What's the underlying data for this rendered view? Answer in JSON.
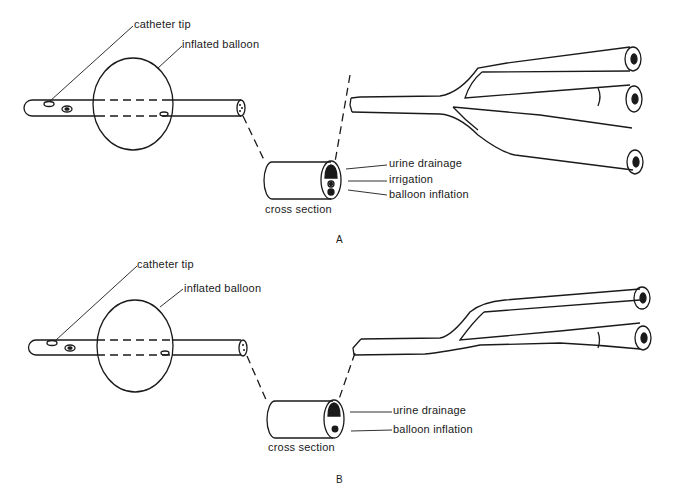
{
  "diagram": {
    "line_color": "#1a1a1a",
    "panels": [
      {
        "id": "A",
        "panel_label": "A",
        "labels": {
          "catheter_tip": "catheter tip",
          "inflated_balloon": "inflated balloon",
          "cross_section": "cross section",
          "lumens": [
            "urine drainage",
            "irrigation",
            "balloon inflation"
          ]
        },
        "ports": 3
      },
      {
        "id": "B",
        "panel_label": "B",
        "labels": {
          "catheter_tip": "catheter tip",
          "inflated_balloon": "inflated balloon",
          "cross_section": "cross section",
          "lumens": [
            "urine drainage",
            "balloon inflation"
          ]
        },
        "ports": 2
      }
    ]
  }
}
